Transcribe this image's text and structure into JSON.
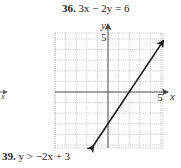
{
  "problem": {
    "number": "36.",
    "equation": "3x − 2y = 6"
  },
  "next_problem": {
    "number": "39.",
    "inequality": "y > −2x + 3"
  },
  "left_fragment": {
    "axis_label": "x"
  },
  "chart_data": {
    "type": "line",
    "title": "3x − 2y = 6",
    "xlabel": "x",
    "ylabel": "y",
    "xlim": [
      -5,
      5
    ],
    "ylim": [
      -5,
      5
    ],
    "grid": true,
    "grid_style": "dotted",
    "tick_labels": {
      "x": [
        "5"
      ],
      "y": [
        "5"
      ]
    },
    "series": [
      {
        "name": "3x − 2y = 6",
        "equation": "y = 1.5x − 3",
        "x": [
          -1.4,
          0,
          2,
          5.2
        ],
        "y": [
          -5.1,
          -3,
          0,
          4.8
        ],
        "arrows": "both",
        "color": "#1a1a1a"
      }
    ],
    "intercepts": {
      "x_intercept": [
        2,
        0
      ],
      "y_intercept": [
        0,
        -3
      ]
    }
  }
}
